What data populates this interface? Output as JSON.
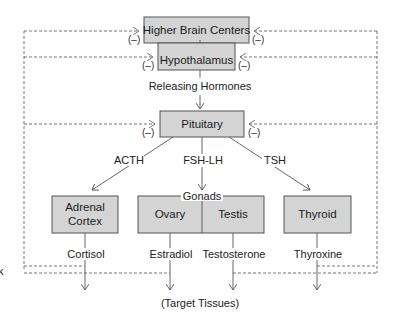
{
  "diagram": {
    "colors": {
      "box_fill": "#d4d4d4",
      "box_stroke": "#555555",
      "line": "#555555",
      "dashed": "#666666"
    },
    "nodes": {
      "higher_brain_centers": "Higher Brain Centers",
      "hypothalamus": "Hypothalamus",
      "pituitary": "Pituitary",
      "adrenal_cortex_line1": "Adrenal",
      "adrenal_cortex_line2": "Cortex",
      "gonads": "Gonads",
      "ovary": "Ovary",
      "testis": "Testis",
      "thyroid": "Thyroid"
    },
    "edge_labels": {
      "releasing_hormones": "Releasing Hormones",
      "acth": "ACTH",
      "fsh_lh": "FSH-LH",
      "tsh": "TSH"
    },
    "hormones": {
      "cortisol": "Cortisol",
      "estradiol": "Estradiol",
      "testosterone": "Testosterone",
      "thyroxine": "Thyroxine"
    },
    "target": "(Target Tissues)",
    "feedback_label": "(–)",
    "edge_fragment": "k"
  }
}
